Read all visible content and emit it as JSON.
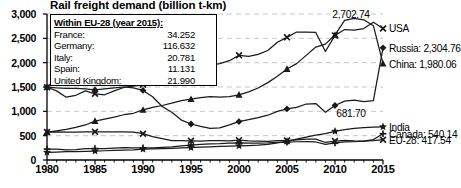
{
  "chart_data": {
    "type": "line",
    "title": "Rail freight demand (billion t-km)",
    "xlabel": "",
    "ylabel": "",
    "xlim": [
      1980,
      2015
    ],
    "ylim": [
      0,
      3000
    ],
    "grid": true,
    "legend_position": "right-inline",
    "x_ticks": [
      "1980",
      "1985",
      "1990",
      "1995",
      "2000",
      "2005",
      "2010",
      "2015"
    ],
    "x_tick_values": [
      1980,
      1985,
      1990,
      1995,
      2000,
      2005,
      2010,
      2015
    ],
    "y_ticks": [
      "0",
      "500",
      "1,000",
      "1,500",
      "2,000",
      "2,500",
      "3,000"
    ],
    "y_tick_values": [
      0,
      500,
      1000,
      1500,
      2000,
      2500,
      3000
    ],
    "x": [
      1980,
      1981,
      1982,
      1983,
      1984,
      1985,
      1986,
      1987,
      1988,
      1989,
      1990,
      1991,
      1992,
      1993,
      1994,
      1995,
      1996,
      1997,
      1998,
      1999,
      2000,
      2001,
      2002,
      2003,
      2004,
      2005,
      2006,
      2007,
      2008,
      2009,
      2010,
      2011,
      2012,
      2013,
      2014,
      2015
    ],
    "series": [
      {
        "name": "USA",
        "marker": "x",
        "end_value": 2702.74,
        "end_label": "USA",
        "value_label": "2,702.74",
        "values": [
          1495,
          1420,
          1290,
          1330,
          1420,
          1360,
          1340,
          1420,
          1490,
          1520,
          1545,
          1540,
          1580,
          1620,
          1730,
          1830,
          1890,
          1950,
          1980,
          2040,
          2150,
          2130,
          2170,
          2250,
          2420,
          2520,
          2630,
          2630,
          2620,
          2230,
          2560,
          2680,
          2670,
          2700,
          2830,
          2702.74
        ]
      },
      {
        "name": "Russia",
        "marker": "diamond",
        "end_value": 2304.76,
        "end_label": "Russia: 2,304.76",
        "value_label": "",
        "values": [
          1495,
          1480,
          1470,
          1470,
          1460,
          1440,
          1460,
          1480,
          1500,
          1480,
          1430,
          1300,
          1100,
          980,
          820,
          740,
          690,
          650,
          660,
          720,
          790,
          830,
          870,
          920,
          1000,
          1050,
          1080,
          1150,
          1160,
          980,
          1120,
          1210,
          1230,
          1200,
          1220,
          2304.76
        ]
      },
      {
        "name": "China",
        "marker": "triangle",
        "end_value": 1980.06,
        "end_label": "China: 1,980.06",
        "value_label": "",
        "values": [
          572,
          600,
          630,
          670,
          720,
          800,
          840,
          880,
          930,
          960,
          1030,
          1080,
          1120,
          1170,
          1220,
          1250,
          1280,
          1300,
          1290,
          1300,
          1340,
          1400,
          1480,
          1590,
          1720,
          1870,
          1980,
          2150,
          2320,
          2380,
          2570,
          2870,
          2910,
          2880,
          2760,
          1980.06
        ]
      },
      {
        "name": "India",
        "marker": "star",
        "end_value": 681.7,
        "end_label": "India",
        "value_label": "681.70",
        "values": [
          158,
          164,
          170,
          173,
          176,
          182,
          190,
          196,
          203,
          210,
          222,
          228,
          235,
          240,
          248,
          254,
          263,
          270,
          278,
          285,
          290,
          297,
          305,
          320,
          350,
          385,
          430,
          470,
          510,
          540,
          590,
          625,
          650,
          665,
          675,
          681.7
        ]
      },
      {
        "name": "Canada",
        "marker": "plus",
        "end_value": 540.14,
        "end_label": "Canada: 540.14",
        "value_label": "",
        "values": [
          224,
          222,
          210,
          215,
          232,
          235,
          236,
          245,
          252,
          248,
          249,
          250,
          258,
          268,
          290,
          308,
          320,
          330,
          335,
          345,
          352,
          345,
          348,
          350,
          360,
          365,
          375,
          380,
          370,
          320,
          350,
          370,
          375,
          390,
          420,
          540.14
        ]
      },
      {
        "name": "EU-28",
        "marker": "x",
        "end_value": 417.54,
        "end_label": "EU-28: 417.54",
        "value_label": "",
        "values": [
          575,
          580,
          572,
          573,
          580,
          580,
          578,
          578,
          580,
          572,
          540,
          480,
          440,
          400,
          400,
          395,
          390,
          400,
          400,
          395,
          408,
          395,
          388,
          385,
          400,
          400,
          415,
          430,
          430,
          360,
          390,
          405,
          395,
          390,
          400,
          417.54
        ]
      }
    ],
    "inner_legend": {
      "header": "Within EU-28 (year 2015):",
      "rows": [
        {
          "label": "France:",
          "value": "34.252"
        },
        {
          "label": "Germany:",
          "value": "116.632"
        },
        {
          "label": "Italy:",
          "value": "20.781"
        },
        {
          "label": "Spain:",
          "value": "11.131"
        },
        {
          "label": "United Kingdom:",
          "value": "21.990"
        }
      ]
    },
    "colors": {
      "line": "#1a1a1a",
      "grid": "#bfbfbf",
      "axis": "#000000",
      "background": "#ffffff"
    }
  }
}
